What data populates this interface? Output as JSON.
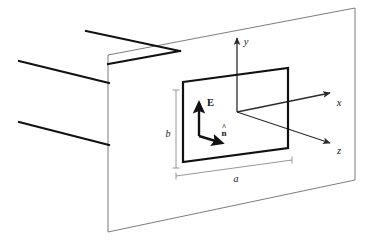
{
  "figure": {
    "colors": {
      "background": "#ffffff",
      "screen_outline": "#7d7d7d",
      "aperture_edge": "#111111",
      "wavefront_ray": "#111111",
      "axis": "#2b2b2b",
      "dimension_line": "#8c8c8c",
      "label_text": "#1a1a1a"
    },
    "axes": [
      {
        "id": "y",
        "label": "y",
        "direction": "up",
        "label_x": 246,
        "label_y": 45
      },
      {
        "id": "x",
        "label": "x",
        "direction": "up-right",
        "label_x": 339,
        "label_y": 106
      },
      {
        "id": "z",
        "label": "z",
        "direction": "down-right",
        "label_x": 339,
        "label_y": 154
      }
    ],
    "vectors": [
      {
        "id": "E",
        "label": "E",
        "bold": true,
        "hat": false,
        "direction": "up",
        "label_x": 207,
        "label_y": 106
      },
      {
        "id": "nhat",
        "label": "n",
        "bold": true,
        "hat": true,
        "direction": "right",
        "label_x": 224,
        "label_y": 134
      }
    ],
    "dimensions": [
      {
        "id": "b",
        "label": "b",
        "orientation": "vertical",
        "label_x": 168,
        "label_y": 137
      },
      {
        "id": "a",
        "label": "a",
        "orientation": "horizontal",
        "label_x": 236,
        "label_y": 182
      }
    ],
    "wavefront_rays": [
      {
        "id": "ray-top",
        "x1": 86,
        "y1": 31,
        "x2": 180,
        "y2": 51
      },
      {
        "id": "ray-middle",
        "x1": 19,
        "y1": 61,
        "x2": 109,
        "y2": 83
      },
      {
        "id": "ray-bottom",
        "x1": 19,
        "y1": 122,
        "x2": 109,
        "y2": 145
      }
    ],
    "screen": {
      "id": "screen-plane",
      "points": "108,55 355,8 355,180 108,232"
    },
    "aperture": {
      "id": "aperture-rect",
      "points": "183,82 288,68 288,148 183,162"
    }
  }
}
